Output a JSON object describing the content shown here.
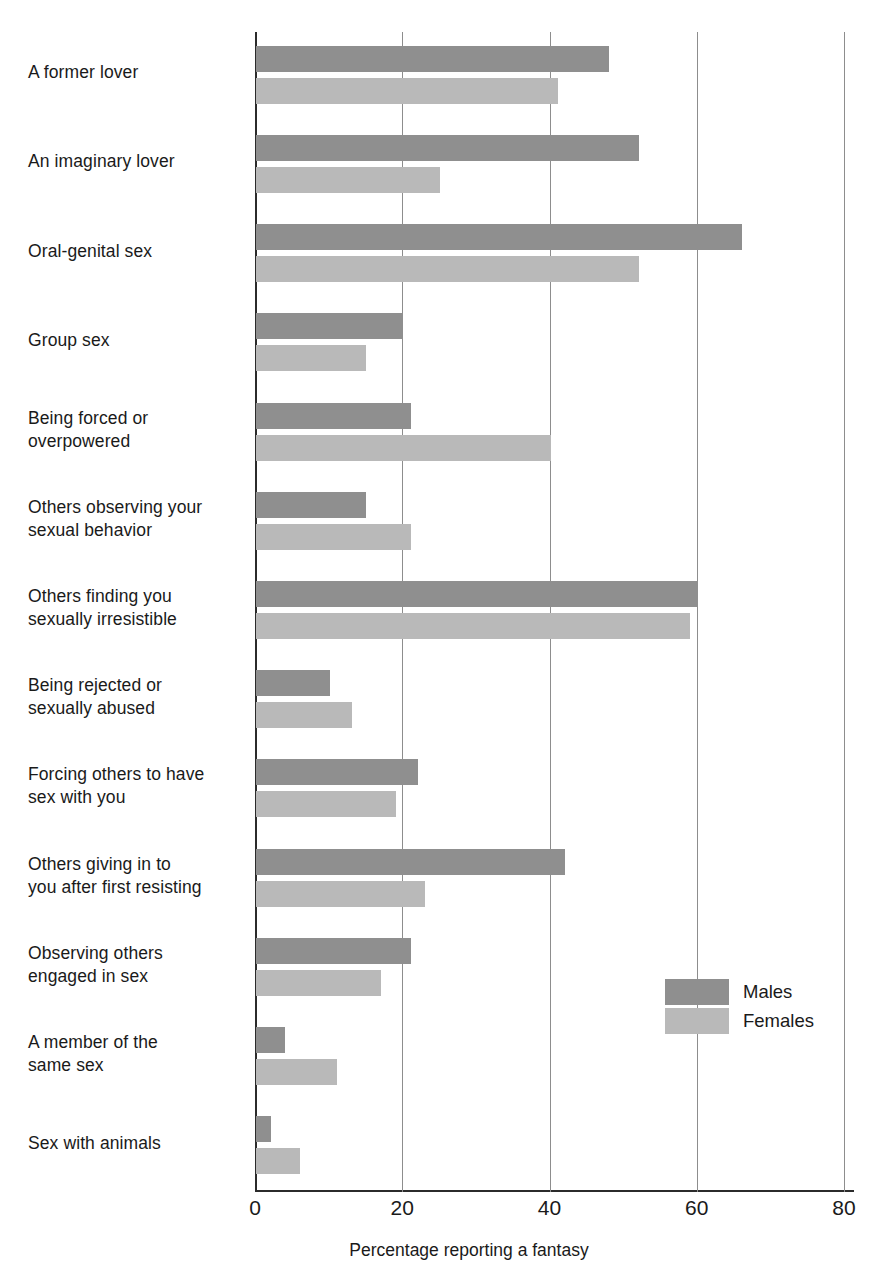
{
  "chart_data": {
    "type": "bar",
    "orientation": "horizontal",
    "title": "",
    "xlabel": "Percentage reporting a fantasy",
    "ylabel": "",
    "xlim": [
      0,
      80
    ],
    "xticks": [
      0,
      20,
      40,
      60,
      80
    ],
    "xtick_labels": [
      "0",
      "20",
      "40",
      "60",
      "80"
    ],
    "grid": "vertical",
    "legend_position": "inside-right",
    "categories": [
      "A former lover",
      "An imaginary lover",
      "Oral-genital sex",
      "Group sex",
      "Being forced or overpowered",
      "Others observing your sexual behavior",
      "Others finding you sexually irresistible",
      "Being rejected or sexually abused",
      "Forcing others to have sex with you",
      "Others giving in to you after first resisting",
      "Observing others engaged in sex",
      "A member of the same sex",
      "Sex with animals"
    ],
    "category_lines": [
      [
        "A former lover"
      ],
      [
        "An imaginary lover"
      ],
      [
        "Oral-genital sex"
      ],
      [
        "Group sex"
      ],
      [
        "Being forced or",
        "overpowered"
      ],
      [
        "Others observing your",
        "sexual behavior"
      ],
      [
        "Others finding you",
        "sexually irresistible"
      ],
      [
        "Being rejected or",
        "sexually abused"
      ],
      [
        "Forcing others to have",
        "sex with you"
      ],
      [
        "Others giving in to",
        "you after first resisting"
      ],
      [
        "Observing others",
        "engaged in sex"
      ],
      [
        "A member of the",
        "same sex"
      ],
      [
        "Sex with animals"
      ]
    ],
    "series": [
      {
        "name": "Males",
        "color": "#8f8f8f",
        "values": [
          48,
          52,
          66,
          20,
          21,
          15,
          60,
          10,
          22,
          42,
          21,
          4,
          2
        ]
      },
      {
        "name": "Females",
        "color": "#b9b9b9",
        "values": [
          41,
          25,
          52,
          15,
          40,
          21,
          59,
          13,
          19,
          23,
          17,
          11,
          6
        ]
      }
    ]
  },
  "legend": {
    "items": [
      {
        "label": "Males",
        "swatch": "males-swatch"
      },
      {
        "label": "Females",
        "swatch": "females-swatch"
      }
    ]
  },
  "axis": {
    "x_title": "Percentage reporting a fantasy"
  }
}
